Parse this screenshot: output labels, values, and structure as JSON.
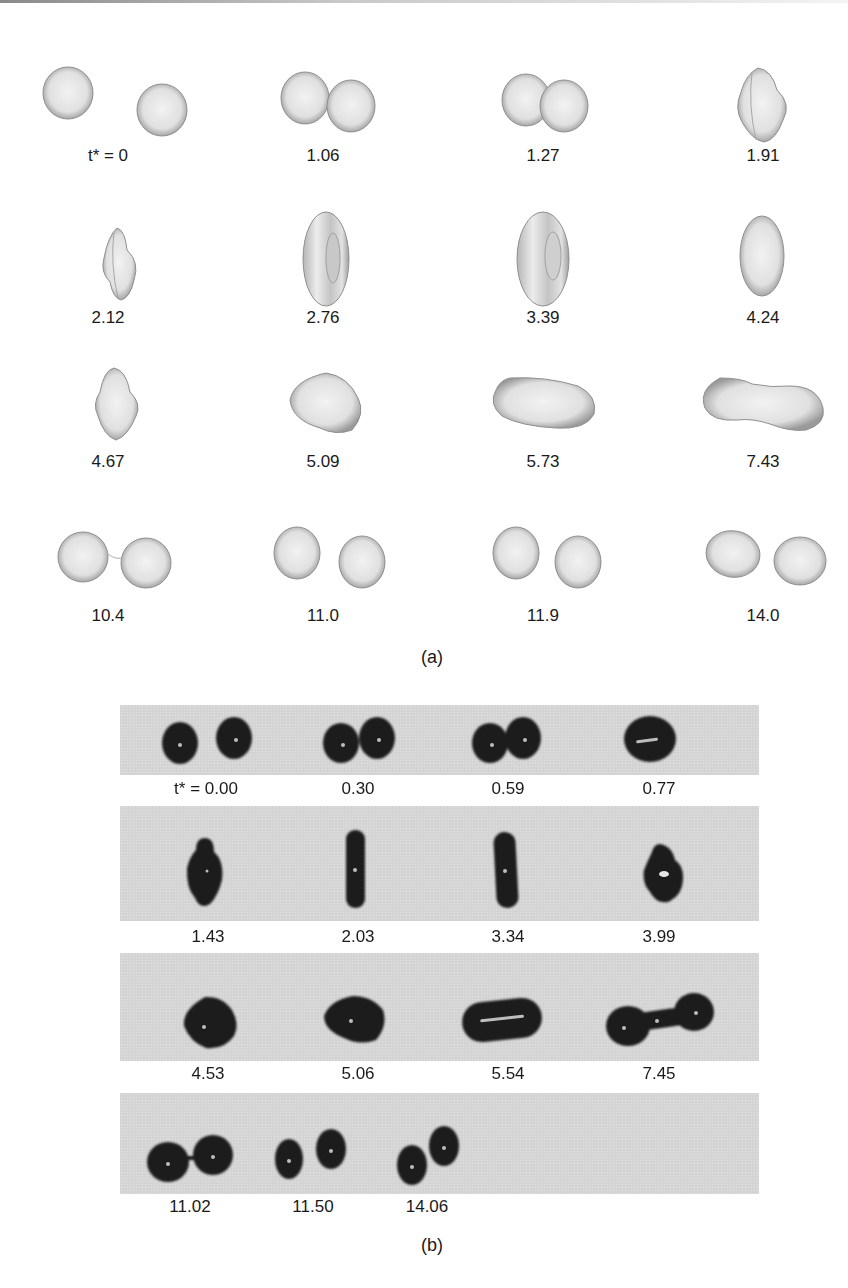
{
  "figure_a": {
    "caption": "(a)",
    "description": "Simulated 3D droplet collision sequence",
    "frames": [
      {
        "label": "t* = 0",
        "shape": "two-separate-drops"
      },
      {
        "label": "1.06",
        "shape": "two-drops-touching"
      },
      {
        "label": "1.27",
        "shape": "two-drops-merging"
      },
      {
        "label": "1.91",
        "shape": "merged-disk-with-ridges"
      },
      {
        "label": "2.12",
        "shape": "vertical-disk-ridged"
      },
      {
        "label": "2.76",
        "shape": "vertical-torus"
      },
      {
        "label": "3.39",
        "shape": "vertical-torus"
      },
      {
        "label": "4.24",
        "shape": "vertical-ellipsoid"
      },
      {
        "label": "4.67",
        "shape": "vertical-diamond"
      },
      {
        "label": "5.09",
        "shape": "rounded-blob"
      },
      {
        "label": "5.73",
        "shape": "horizontal-capsule"
      },
      {
        "label": "7.43",
        "shape": "horizontal-dumbbell"
      },
      {
        "label": "10.4",
        "shape": "two-drops-thin-neck"
      },
      {
        "label": "11.0",
        "shape": "two-separate-drops"
      },
      {
        "label": "11.9",
        "shape": "two-separate-drops"
      },
      {
        "label": "14.0",
        "shape": "two-separate-drops"
      }
    ]
  },
  "figure_b": {
    "caption": "(b)",
    "description": "Experimental photographs of droplet collision sequence",
    "rows": [
      {
        "labels": [
          "t* = 0.00",
          "0.30",
          "0.59",
          "0.77"
        ]
      },
      {
        "labels": [
          "1.43",
          "2.03",
          "3.34",
          "3.99"
        ]
      },
      {
        "labels": [
          "4.53",
          "5.06",
          "5.54",
          "7.45"
        ]
      },
      {
        "labels": [
          "11.02",
          "11.50",
          "14.06"
        ]
      }
    ]
  },
  "colors": {
    "drop_light": "#e8e8e8",
    "drop_edge": "#8c8c8c",
    "photo_bg": "#d4d4d4",
    "photo_drop": "#1f1f1f"
  }
}
